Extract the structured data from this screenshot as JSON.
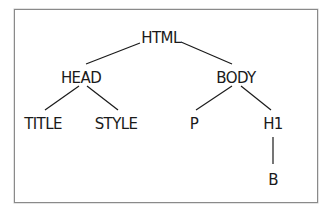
{
  "diagram": {
    "type": "tree",
    "title": "",
    "nodes": [
      {
        "id": "html",
        "label": "HTML",
        "x": 161,
        "y": 30
      },
      {
        "id": "head",
        "label": "HEAD",
        "x": 81,
        "y": 70
      },
      {
        "id": "body",
        "label": "BODY",
        "x": 236,
        "y": 70
      },
      {
        "id": "title",
        "label": "TITLE",
        "x": 43,
        "y": 116
      },
      {
        "id": "style",
        "label": "STYLE",
        "x": 116,
        "y": 116
      },
      {
        "id": "p",
        "label": "P",
        "x": 194,
        "y": 116
      },
      {
        "id": "h1",
        "label": "H1",
        "x": 273,
        "y": 116
      },
      {
        "id": "b",
        "label": "B",
        "x": 273,
        "y": 172
      }
    ],
    "edges": [
      {
        "from": "html",
        "to": "head",
        "x1": 140,
        "y1": 43,
        "x2": 86,
        "y2": 64
      },
      {
        "from": "html",
        "to": "body",
        "x1": 181,
        "y1": 42,
        "x2": 232,
        "y2": 64
      },
      {
        "from": "head",
        "to": "title",
        "x1": 79,
        "y1": 86,
        "x2": 45,
        "y2": 110
      },
      {
        "from": "head",
        "to": "style",
        "x1": 87,
        "y1": 86,
        "x2": 118,
        "y2": 110
      },
      {
        "from": "body",
        "to": "p",
        "x1": 232,
        "y1": 86,
        "x2": 196,
        "y2": 110
      },
      {
        "from": "body",
        "to": "h1",
        "x1": 241,
        "y1": 86,
        "x2": 271,
        "y2": 110
      },
      {
        "from": "h1",
        "to": "b",
        "x1": 273,
        "y1": 137,
        "x2": 273,
        "y2": 164
      }
    ],
    "colors": {
      "line": "#1a1a1a",
      "text": "#1a1a1a",
      "border": "#8a8a8a"
    }
  }
}
